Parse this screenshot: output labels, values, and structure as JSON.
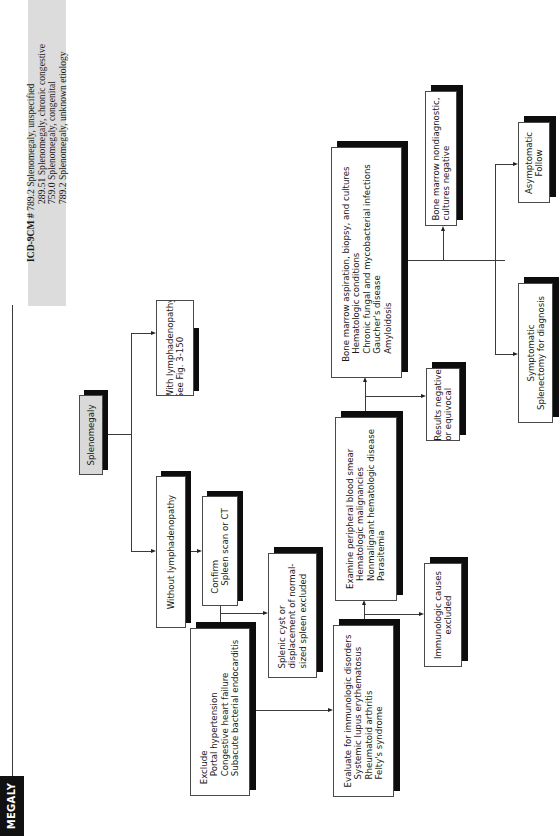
{
  "header": {
    "section_title": "MEGALY",
    "icd": {
      "label": "ICD-9CM #",
      "codes": [
        "789.2 Splenomegaly, unspecified",
        "289.51 Splenomegaly, chronic congestive",
        "759.0 Splenomegaly, congenital",
        "789.2 Splenomegaly, unknown etiology"
      ]
    }
  },
  "flowchart": {
    "orientation": "rotated-90-ccw",
    "nodes": {
      "root": {
        "lines": [
          "Splenomegaly"
        ]
      },
      "with_lymph": {
        "lines": [
          "With lymphadenopathy",
          "See Fig. 3-150"
        ]
      },
      "without_lymph": {
        "lines": [
          "Without lymphadenopathy"
        ]
      },
      "confirm": {
        "lines": [
          "Confirm",
          "Spleen scan or CT"
        ]
      },
      "splenic_cyst": {
        "lines": [
          "Splenic cyst or",
          "displacement of normal-",
          "sized spleen excluded"
        ]
      },
      "exclude": {
        "lines": [
          "Exclude",
          "Portal hypertension",
          "Congestive heart failure",
          "Subacute bacterial endocarditis"
        ]
      },
      "evaluate_immuno": {
        "lines": [
          "Evaluate for immunologic disorders",
          "Systemic lupus erythematosus",
          "Rheumatoid arthritis",
          "Felty's syndrome"
        ]
      },
      "immuno_excluded": {
        "lines": [
          "Immunologic causes",
          "excluded"
        ]
      },
      "examine_smear": {
        "lines": [
          "Examine peripheral blood smear",
          "Hematologic malignancies",
          "Nonmalignant hematologic disease",
          "Parasitemia"
        ]
      },
      "results_negative": {
        "lines": [
          "Results negative",
          "or equivocal"
        ]
      },
      "bone_marrow": {
        "lines": [
          "Bone marrow aspiration, biopsy, and cultures",
          "Hematologic conditions",
          "Chronic fungal and mycobacterial infections",
          "Gaucher's disease",
          "Amyloidosis"
        ]
      },
      "bm_nondiagnostic": {
        "lines": [
          "Bone marrow nondiagnostic,",
          "cultures negative"
        ]
      },
      "asymptomatic": {
        "lines": [
          "Asymptomatic",
          "Follow"
        ]
      },
      "symptomatic": {
        "lines": [
          "Symptomatic",
          "Splenectomy for diagnosis"
        ]
      }
    },
    "edges": [
      [
        "root",
        "with_lymph"
      ],
      [
        "root",
        "without_lymph"
      ],
      [
        "without_lymph",
        "confirm"
      ],
      [
        "confirm",
        "splenic_cyst"
      ],
      [
        "confirm",
        "exclude"
      ],
      [
        "exclude",
        "evaluate_immuno"
      ],
      [
        "evaluate_immuno",
        "immuno_excluded"
      ],
      [
        "evaluate_immuno",
        "examine_smear"
      ],
      [
        "examine_smear",
        "results_negative"
      ],
      [
        "examine_smear",
        "bone_marrow"
      ],
      [
        "bone_marrow",
        "bm_nondiagnostic"
      ],
      [
        "bone_marrow",
        "asymptomatic"
      ],
      [
        "bone_marrow",
        "symptomatic"
      ]
    ]
  }
}
